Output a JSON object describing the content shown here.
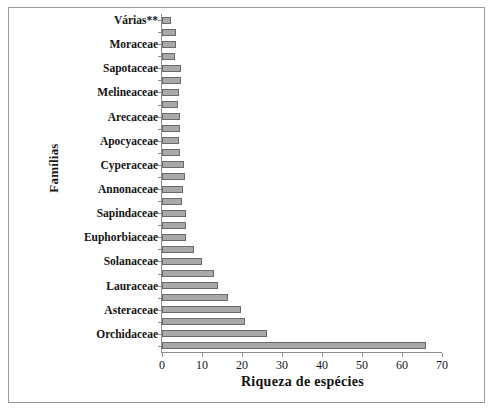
{
  "chart": {
    "title": "",
    "xlabel": "Riqueza de espécies",
    "ylabel": "Famílias",
    "xtick_labels": [
      "0",
      "10",
      "20",
      "30",
      "40",
      "50",
      "60",
      "70"
    ],
    "bar_color": "#a9a9a9",
    "bar_border_color": "#6a6a6a",
    "axis_color": "#8d8d8d",
    "text_color": "#141414",
    "background": "#ffffff"
  },
  "chart_data": {
    "type": "bar",
    "orientation": "horizontal",
    "title": "",
    "xlabel": "Riqueza de espécies",
    "ylabel": "Famílias",
    "xlim": [
      0,
      70
    ],
    "xticks": [
      0,
      10,
      20,
      30,
      40,
      50,
      60,
      70
    ],
    "grid": false,
    "legend": null,
    "note": "28 bars plotted; alternating bars carry a family name label on the y axis, the interleaved bars are unlabeled",
    "categories": [
      "Várias**",
      "",
      "Moraceae",
      "",
      "Sapotaceae",
      "",
      "Melineaceae",
      "",
      "Arecaceae",
      "",
      "Apocyaceae",
      "",
      "Cyperaceae",
      "",
      "Annonaceae",
      "",
      "Sapindaceae",
      "",
      "Euphorbiaceae",
      "",
      "Solanaceae",
      "",
      "Lauraceae",
      "",
      "Asteraceae",
      "",
      "Orchidaceae",
      ""
    ],
    "values": [
      2.3,
      3.5,
      3.4,
      3.3,
      4.7,
      4.7,
      4.3,
      4.1,
      4.5,
      4.5,
      4.3,
      4.5,
      5.6,
      5.8,
      5.3,
      5.1,
      6.1,
      6.1,
      6.1,
      8.0,
      10.1,
      13.0,
      14.0,
      16.6,
      19.8,
      20.8,
      26.2,
      66.0
    ],
    "labeled_categories": [
      "Várias**",
      "Moraceae",
      "Sapotaceae",
      "Melineaceae",
      "Arecaceae",
      "Apocyaceae",
      "Cyperaceae",
      "Annonaceae",
      "Sapindaceae",
      "Euphorbiaceae",
      "Solanaceae",
      "Lauraceae",
      "Asteraceae",
      "Orchidaceae"
    ],
    "labeled_values": [
      2.3,
      3.4,
      4.7,
      4.3,
      4.5,
      4.3,
      5.6,
      5.3,
      6.1,
      6.1,
      10.1,
      14.0,
      19.8,
      26.2
    ]
  }
}
